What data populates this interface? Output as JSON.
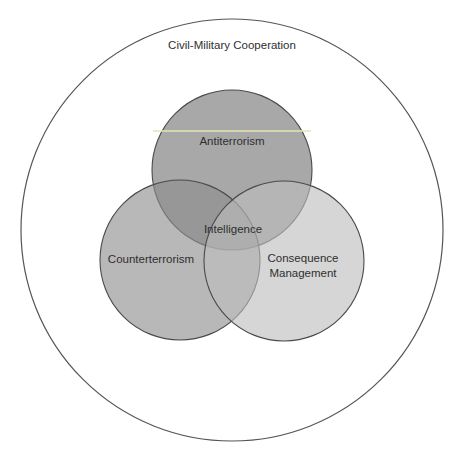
{
  "diagram": {
    "type": "venn",
    "outer": {
      "label": "Civil-Military Cooperation",
      "cx": 232,
      "cy": 230,
      "r": 211,
      "fill": "#ffffff",
      "stroke": "#555555"
    },
    "circles": [
      {
        "id": "antiterrorism",
        "label": "Antiterrorism",
        "cx": 232,
        "cy": 170,
        "r": 80,
        "fill": "#a6a6a6",
        "opacity": 0.95
      },
      {
        "id": "counterterrorism",
        "label": "Counterterrorism",
        "cx": 180,
        "cy": 260,
        "r": 80,
        "fill": "#9a9a9a",
        "opacity": 0.72
      },
      {
        "id": "consequence-management",
        "label_line1": "Consequence",
        "label_line2": "Management",
        "cx": 284,
        "cy": 261,
        "r": 80,
        "fill": "#bdbdbd",
        "opacity": 0.62
      }
    ],
    "center_label": "Intelligence",
    "accent_line_color": "#e4e6b0",
    "stroke_color": "#4a4a4a",
    "text_color": "#2f2f2f"
  }
}
